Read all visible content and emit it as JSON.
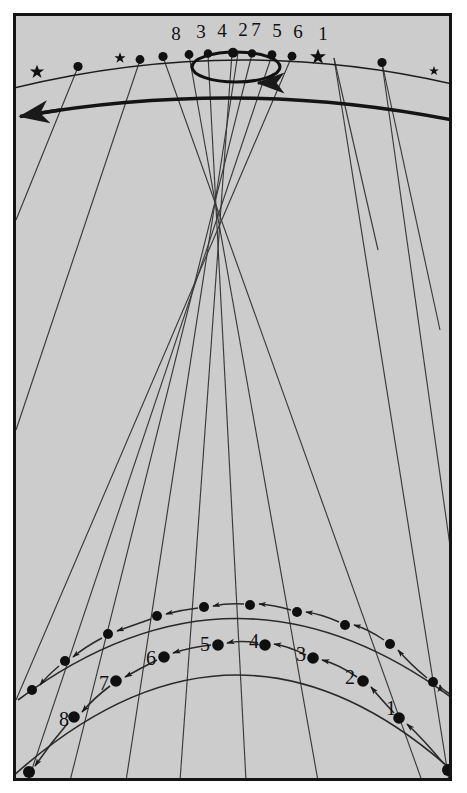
{
  "figure": {
    "background_color": "#cccccc",
    "ink_color": "#1a1a1a",
    "frame": {
      "x": 13,
      "y": 13,
      "width": 439,
      "height": 768,
      "border_width": 3
    },
    "cropped_text_above": "y   g y   p"
  },
  "top_arc": {
    "name": "celestial-arc",
    "labels": [
      "8",
      "3",
      "4",
      "2",
      "7",
      "5",
      "6",
      "1"
    ],
    "label_x": [
      176,
      201,
      222,
      243,
      256,
      276,
      297,
      322
    ],
    "label_y": 34,
    "dots_x": [
      78,
      140,
      163,
      189,
      208,
      232,
      252,
      272,
      292,
      334,
      382,
      430
    ],
    "stars_x": [
      37,
      120,
      318,
      434
    ],
    "marker_kinds": [
      "star",
      "dot",
      "star",
      "dot",
      "dot",
      "dot",
      "dot",
      "dot",
      "dot",
      "dot",
      "star",
      "dot",
      "dot",
      "star"
    ]
  },
  "ellipse": {
    "name": "rotation-ellipse",
    "cx": 236,
    "cy": 67,
    "rx": 44,
    "ry": 15,
    "arrow_label": "clockwise-rotation-arrow"
  },
  "horizon": {
    "name": "horizon-curve",
    "arrow_label": "leftward-arrow",
    "arrow_x": 18,
    "arrow_y": 117
  },
  "bottom_arcs": [
    {
      "name": "outer-bottom-arc",
      "labels": [
        "1",
        "2",
        "3",
        "4",
        "5",
        "6",
        "7",
        "8"
      ],
      "label_positions": [
        {
          "t": "1",
          "x": 391,
          "y": 708
        },
        {
          "t": "2",
          "x": 352,
          "y": 676
        },
        {
          "t": "3",
          "x": 303,
          "y": 652
        },
        {
          "t": "4",
          "x": 255,
          "y": 639
        },
        {
          "t": "5",
          "x": 206,
          "y": 642
        },
        {
          "t": "6",
          "x": 152,
          "y": 656
        },
        {
          "t": "7",
          "x": 105,
          "y": 681
        },
        {
          "t": "8",
          "x": 66,
          "y": 717
        }
      ]
    },
    {
      "name": "inner-bottom-arc",
      "labels": []
    }
  ],
  "counts": {
    "sight_lines": 8,
    "top_markers": 14,
    "numbered_points": 8
  }
}
